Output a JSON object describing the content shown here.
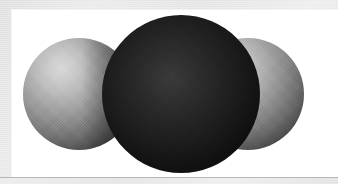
{
  "figure": {
    "caption": "",
    "kind": "space-filling molecular model",
    "layout": "linear triatomic, side-on view",
    "panel": {
      "background_color": "#ffffff",
      "surround_color": "#e8e8e8",
      "rule_color": "#b9b9b9"
    }
  },
  "molecule": {
    "geometry": "linear",
    "atom_count": 3,
    "atoms": [
      {
        "id": "atom-left",
        "role": "terminal",
        "label": "",
        "shade": "medium gray",
        "fill_color": "#8c8c8c",
        "highlight_color": "#d8d8d8",
        "shadow_color": "#1e1e1e",
        "diameter_px": 112,
        "center_x_px": 79,
        "center_y_px": 94,
        "highlight_position": "upper-left",
        "z_order": 1
      },
      {
        "id": "atom-center",
        "role": "central",
        "label": "",
        "shade": "near black",
        "fill_color": "#1c1c1c",
        "highlight_color": "#3a3a3a",
        "shadow_color": "#030303",
        "diameter_px": 158,
        "center_x_px": 181,
        "center_y_px": 94,
        "highlight_position": "upper-left of center",
        "z_order": 3
      },
      {
        "id": "atom-right",
        "role": "terminal",
        "label": "",
        "shade": "medium gray",
        "fill_color": "#8c8c8c",
        "highlight_color": "#d8d8d8",
        "shadow_color": "#1e1e1e",
        "diameter_px": 112,
        "center_x_px": 248,
        "center_y_px": 94,
        "highlight_position": "upper-left",
        "z_order": 2
      }
    ],
    "lighting": {
      "source": "upper-left",
      "description": "single diffuse key light from the upper left producing a bright spot on each sphere and a dark terminator toward the lower right"
    }
  },
  "accessibility": {
    "alt_text": "Grayscale space-filling model of a linear triatomic molecule: a large dark central sphere overlapping two smaller medium-gray spheres, one on each side."
  }
}
